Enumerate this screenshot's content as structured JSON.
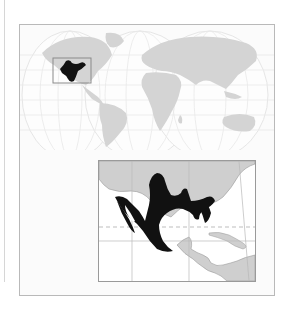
{
  "figure": {
    "type": "range-map",
    "world_map": {
      "projection": "interrupted-two-lobe",
      "land_color": "#d2d2d2",
      "ocean_color": "#fbfbfb",
      "graticule_color": "#e3e3e3",
      "highlight_region": "Mexico",
      "highlight_color": "#111111",
      "locator_box": {
        "label": "inset-extent",
        "stroke": "#8a8a8a"
      }
    },
    "inset_map": {
      "region": "Mexico and Central America",
      "range_color": "#111111",
      "land_color": "#cfcfcf",
      "water_color": "#ffffff",
      "graticule_color": "#b9b9b9",
      "reference_line": {
        "name": "Tropic of Cancer",
        "style": "dashed",
        "color": "#bdbdbd"
      }
    }
  },
  "colors": {
    "frame_border": "#b9b9b9",
    "inset_border": "#9a9a9a",
    "background": "#ffffff"
  }
}
